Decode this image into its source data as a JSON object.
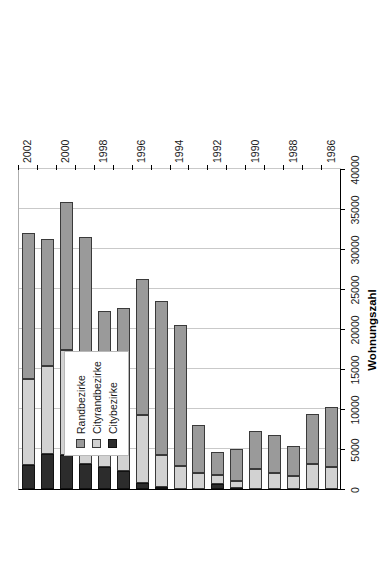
{
  "chart_data": {
    "type": "bar",
    "subtype": "stacked-horizontal",
    "title": "",
    "xlabel": "",
    "ylabel": "Wohnungszahl",
    "ylim": [
      0,
      40000
    ],
    "ytick_step": 5000,
    "yticks": [
      "0",
      "5000",
      "10000",
      "15000",
      "20000",
      "25000",
      "30000",
      "35000",
      "40000"
    ],
    "grid": true,
    "legend_position": "inside-left",
    "orientation_note": "chart rendered rotated 90 degrees on the page",
    "categories": [
      "1986",
      "1987",
      "1988",
      "1989",
      "1990",
      "1991",
      "1992",
      "1993",
      "1994",
      "1995",
      "1996",
      "1997",
      "1998",
      "1999",
      "2000",
      "2001",
      "2002"
    ],
    "category_tick_labels": [
      "1986",
      "1988",
      "1990",
      "1992",
      "1994",
      "1996",
      "1998",
      "2000",
      "2002"
    ],
    "stack_order_from_baseline": [
      "Citybezirke",
      "Cityrandbezirke",
      "Randbezirke"
    ],
    "series": [
      {
        "name": "Citybezirke",
        "color": "#2c2c2c",
        "values": [
          0,
          0,
          0,
          0,
          0,
          150,
          600,
          0,
          0,
          200,
          700,
          2300,
          2800,
          3100,
          4250,
          4400,
          3000
        ]
      },
      {
        "name": "Cityrandbezirke",
        "color": "#d2d2d2",
        "values": [
          2750,
          3100,
          1600,
          2000,
          2500,
          900,
          1200,
          2000,
          2900,
          4000,
          8500,
          6700,
          6900,
          10100,
          13100,
          11000,
          10750
        ]
      },
      {
        "name": "Randbezirke",
        "color": "#9a9a9a",
        "values": [
          7500,
          6300,
          3800,
          4700,
          4800,
          4000,
          2800,
          6000,
          17600,
          19300,
          17000,
          13600,
          12500,
          18300,
          18500,
          15900,
          18250
        ]
      }
    ],
    "totals": [
      10250,
      9400,
      5400,
      6700,
      7300,
      5050,
      4600,
      8000,
      20500,
      23500,
      26200,
      22600,
      22200,
      31500,
      35850,
      31300,
      32000
    ]
  },
  "legend": {
    "items": [
      {
        "label": "Randbezirke",
        "color": "#9a9a9a",
        "swatch": "swatch-randbezirke"
      },
      {
        "label": "Cityrandbezirke",
        "color": "#d2d2d2",
        "swatch": "swatch-cityrandbezirke"
      },
      {
        "label": "Citybezirke",
        "color": "#2c2c2c",
        "swatch": "swatch-citybezirke"
      }
    ]
  },
  "axis_title": "Wohnungszahl"
}
